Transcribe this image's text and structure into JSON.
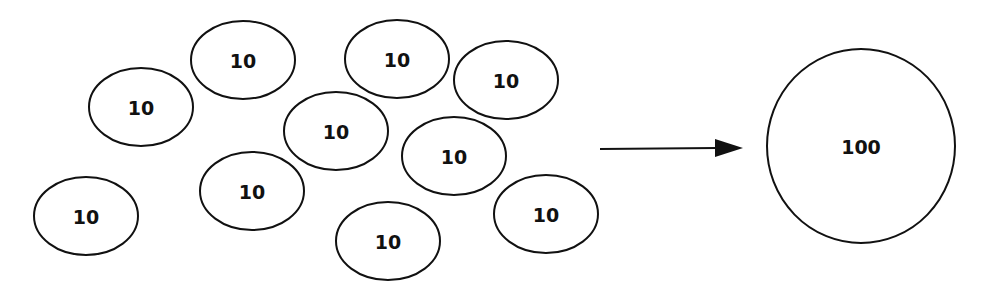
{
  "diagram": {
    "type": "aggregation",
    "description_visible": "ten small ellipses labeled 10 combine into one large circle labeled 100",
    "small_items": [
      {
        "label": "10",
        "cx": 141,
        "cy": 107,
        "rx": 52,
        "ry": 39
      },
      {
        "label": "10",
        "cx": 243,
        "cy": 60,
        "rx": 52,
        "ry": 39
      },
      {
        "label": "10",
        "cx": 86,
        "cy": 216,
        "rx": 52,
        "ry": 39
      },
      {
        "label": "10",
        "cx": 252,
        "cy": 191,
        "rx": 52,
        "ry": 39
      },
      {
        "label": "10",
        "cx": 397,
        "cy": 59,
        "rx": 52,
        "ry": 39
      },
      {
        "label": "10",
        "cx": 506,
        "cy": 80,
        "rx": 52,
        "ry": 39
      },
      {
        "label": "10",
        "cx": 336,
        "cy": 131,
        "rx": 52,
        "ry": 39
      },
      {
        "label": "10",
        "cx": 454,
        "cy": 156,
        "rx": 52,
        "ry": 39
      },
      {
        "label": "10",
        "cx": 546,
        "cy": 214,
        "rx": 52,
        "ry": 39
      },
      {
        "label": "10",
        "cx": 388,
        "cy": 241,
        "rx": 52,
        "ry": 39
      }
    ],
    "arrow": {
      "x1": 600,
      "y1": 149,
      "x2": 743,
      "y2": 148
    },
    "result": {
      "label": "100",
      "cx": 861,
      "cy": 146,
      "rx": 94,
      "ry": 97
    },
    "colors": {
      "stroke": "#111111",
      "fill": "#ffffff",
      "text": "#111111"
    }
  }
}
